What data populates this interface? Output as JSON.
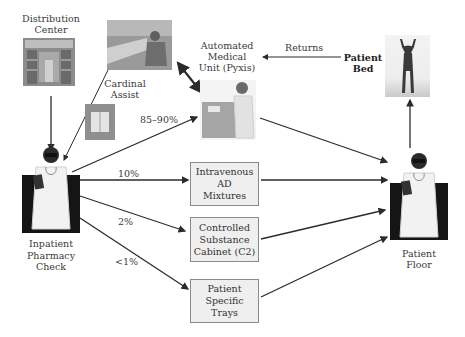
{
  "nodes": {
    "distribution_center": {
      "line1": "Distribution",
      "line2": "Center"
    },
    "cardinal_assist": {
      "line1": "Cardinal",
      "line2": "Assist"
    },
    "pyxis": {
      "line1": "Automated",
      "line2": "Medical",
      "line3": "Unit (Pyxis)"
    },
    "patient_bed": {
      "line1": "Patient",
      "line2": "Bed"
    },
    "inpatient_pharmacy": {
      "line1": "Inpatient",
      "line2": "Pharmacy",
      "line3": "Check"
    },
    "patient_floor": {
      "line1": "Patient",
      "line2": "Floor"
    },
    "iv_mixtures": {
      "line1": "Intravenous",
      "line2": "AD",
      "line3": "Mixtures"
    },
    "controlled_substance": {
      "line1": "Controlled",
      "line2": "Substance",
      "line3": "Cabinet (C2)"
    },
    "patient_trays": {
      "line1": "Patient",
      "line2": "Specific",
      "line3": "Trays"
    }
  },
  "edges": {
    "returns_label": "Returns",
    "pyxis_pct": "85–90%",
    "iv_pct": "10%",
    "c2_pct": "2%",
    "trays_pct": "<1%"
  },
  "colors": {
    "arrow": "#2b2b2b",
    "box_fill": "#efefef",
    "box_border": "#8a8a8a"
  }
}
